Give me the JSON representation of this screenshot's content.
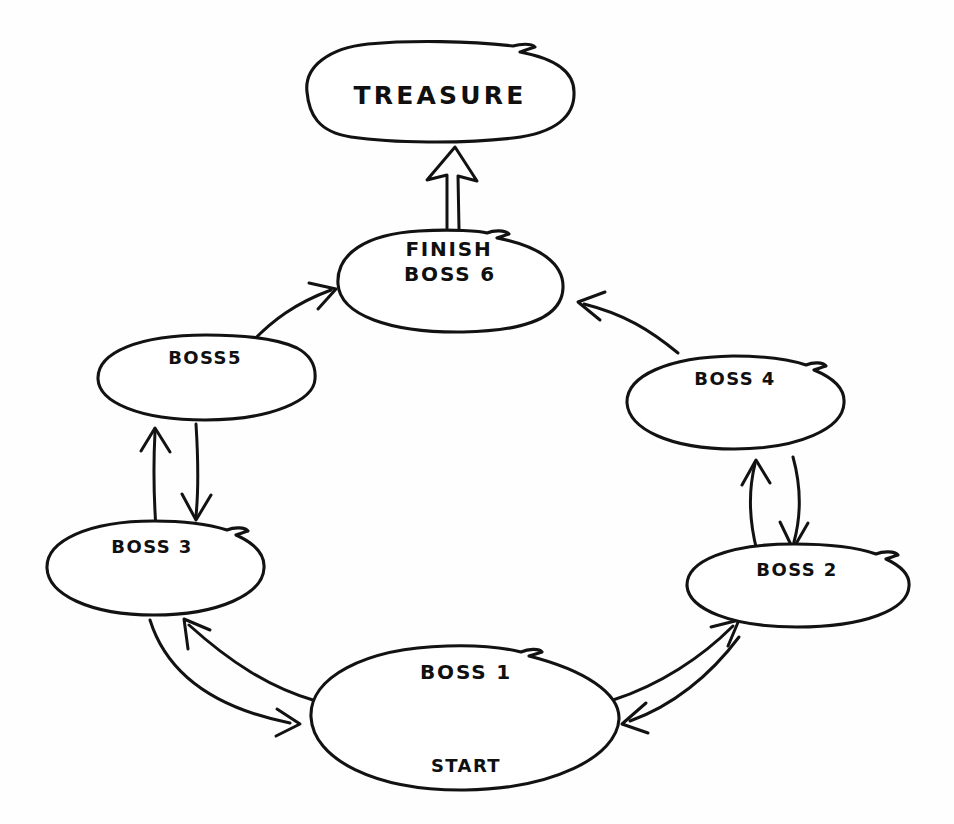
{
  "diagram": {
    "style": "hand-drawn sketch on white paper",
    "background_color": "#fefefe",
    "ink_color": "#121212",
    "nodes": [
      {
        "id": "treasure",
        "label": "TREASURE",
        "shape": "rounded-rectangle",
        "cx": 437,
        "cy": 95
      },
      {
        "id": "boss6",
        "label_line1": "FINISH",
        "label_line2": "BOSS 6",
        "shape": "ellipse",
        "cx": 450,
        "cy": 283
      },
      {
        "id": "boss5",
        "label": "BOSS5",
        "shape": "ellipse",
        "cx": 205,
        "cy": 378
      },
      {
        "id": "boss4",
        "label": "BOSS 4",
        "shape": "ellipse",
        "cx": 735,
        "cy": 402
      },
      {
        "id": "boss3",
        "label": "BOSS 3",
        "shape": "ellipse",
        "cx": 155,
        "cy": 567
      },
      {
        "id": "boss2",
        "label": "BOSS 2",
        "shape": "ellipse",
        "cx": 797,
        "cy": 585
      },
      {
        "id": "boss1",
        "label_line1": "BOSS 1",
        "label_line2": "START",
        "shape": "ellipse",
        "cx": 465,
        "cy": 717
      }
    ],
    "edges": [
      {
        "id": "e-boss6-treasure",
        "from": "boss6",
        "to": "treasure",
        "style": "hollow-outline-arrow",
        "direction": "one-way"
      },
      {
        "id": "e-boss5-boss6",
        "from": "boss5",
        "to": "boss6",
        "style": "curved-arrow",
        "direction": "one-way"
      },
      {
        "id": "e-boss4-boss6",
        "from": "boss4",
        "to": "boss6",
        "style": "curved-arrow",
        "direction": "one-way"
      },
      {
        "id": "e-boss3-boss5",
        "from": "boss3",
        "to": "boss5",
        "style": "straight-arrow",
        "direction": "one-way"
      },
      {
        "id": "e-boss5-boss3",
        "from": "boss5",
        "to": "boss3",
        "style": "straight-arrow",
        "direction": "one-way"
      },
      {
        "id": "e-boss2-boss4",
        "from": "boss2",
        "to": "boss4",
        "style": "straight-arrow",
        "direction": "one-way"
      },
      {
        "id": "e-boss4-boss2",
        "from": "boss4",
        "to": "boss2",
        "style": "straight-arrow",
        "direction": "one-way"
      },
      {
        "id": "e-boss1-boss3",
        "from": "boss1",
        "to": "boss3",
        "style": "curved-arrow",
        "direction": "one-way"
      },
      {
        "id": "e-boss3-boss1",
        "from": "boss3",
        "to": "boss1",
        "style": "curved-arrow",
        "direction": "one-way"
      },
      {
        "id": "e-boss1-boss2",
        "from": "boss1",
        "to": "boss2",
        "style": "curved-arrow",
        "direction": "one-way"
      },
      {
        "id": "e-boss2-boss1",
        "from": "boss2",
        "to": "boss1",
        "style": "curved-arrow",
        "direction": "one-way"
      }
    ]
  }
}
